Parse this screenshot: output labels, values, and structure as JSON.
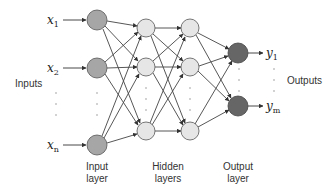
{
  "diagram": {
    "side_labels": {
      "inputs": "Inputs",
      "outputs": "Outputs"
    },
    "layer_labels": {
      "input": [
        "Input",
        "layer"
      ],
      "hidden": [
        "Hidden",
        "layers"
      ],
      "output": [
        "Output",
        "layer"
      ]
    },
    "inputs": [
      {
        "var": "x",
        "sub": "1"
      },
      {
        "var": "x",
        "sub": "2"
      },
      {
        "var": "x",
        "sub": "n"
      }
    ],
    "outputs": [
      {
        "var": "y",
        "sub": "1"
      },
      {
        "var": "y",
        "sub": "m"
      }
    ],
    "colors": {
      "input_node": "#a6a6a6",
      "hidden_node": "#e6e6e6",
      "output_node": "#666666",
      "stroke": "#555555",
      "edge": "#444444"
    }
  }
}
